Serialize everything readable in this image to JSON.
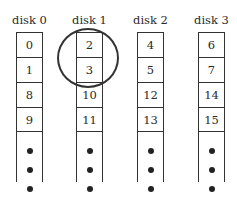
{
  "diagram": {
    "type": "disk-striping",
    "disks": [
      {
        "label": "disk 0",
        "blocks": [
          "0",
          "1",
          "8",
          "9"
        ]
      },
      {
        "label": "disk 1",
        "blocks": [
          "2",
          "3",
          "10",
          "11"
        ]
      },
      {
        "label": "disk 2",
        "blocks": [
          "4",
          "5",
          "12",
          "13"
        ]
      },
      {
        "label": "disk 3",
        "blocks": [
          "6",
          "7",
          "14",
          "15"
        ]
      }
    ],
    "continuation": "•••",
    "highlight": {
      "disk": "disk 1",
      "blocks": [
        "2",
        "3"
      ],
      "shape": "circle"
    }
  }
}
